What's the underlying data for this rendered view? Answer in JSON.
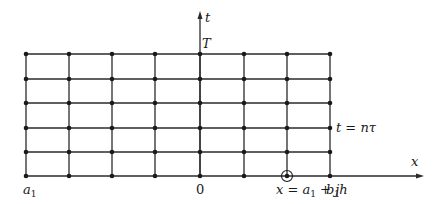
{
  "diagram": {
    "grid": {
      "columns_x": [
        26,
        69,
        112,
        155,
        200,
        244,
        287,
        330
      ],
      "rows_y": [
        54,
        79,
        103,
        128,
        152,
        176
      ],
      "line_color": "#2a2a2a",
      "node_color": "#1a1a1a"
    },
    "axes": {
      "t_axis": {
        "label": "t",
        "top_label": "T"
      },
      "x_axis": {
        "label": "x"
      }
    },
    "labels": {
      "left": "a",
      "left_sub": "1",
      "origin": "0",
      "right": "b",
      "right_sub": "1",
      "row_label": "t = nτ",
      "marked_point_prefix": "x = a",
      "marked_point_sub": "1",
      "marked_point_suffix": " + jh"
    },
    "marked_node": {
      "column_index": 6,
      "row_index": 5
    }
  }
}
